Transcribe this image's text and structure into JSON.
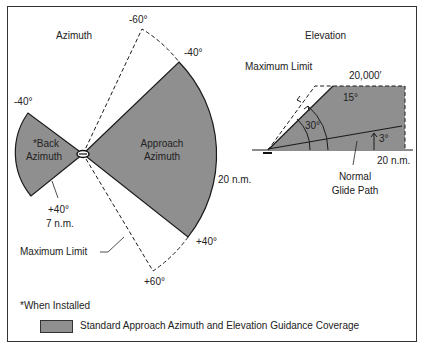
{
  "azimuth": {
    "title": "Azimuth",
    "angle_top_dashed": "-60°",
    "angle_top_approach": "-40°",
    "angle_back_top": "-40°",
    "angle_back_bottom": "+40°",
    "back_range": "7 n.m.",
    "back_label_line1": "*Back",
    "back_label_line2": "Azimuth",
    "approach_label_line1": "Approach",
    "approach_label_line2": "Azimuth",
    "approach_range": "20 n.m.",
    "angle_bottom_approach": "+40°",
    "angle_bottom_dashed": "+60°",
    "max_limit": "Maximum Limit"
  },
  "elevation": {
    "title": "Elevation",
    "max_limit": "Maximum Limit",
    "altitude": "20,000′",
    "angle_15": "15°",
    "angle_30": "30°",
    "angle_3": "3°",
    "range": "20 n.m.",
    "glide_line1": "Normal",
    "glide_line2": "Glide Path"
  },
  "footnote": "*When Installed",
  "legend": {
    "label": "Standard Approach Azimuth and Elevation Guidance Coverage",
    "color": "#8f8f8f"
  },
  "colors": {
    "coverage_fill": "#8f8f8f",
    "line": "#1a1a1a",
    "background": "#ffffff"
  }
}
